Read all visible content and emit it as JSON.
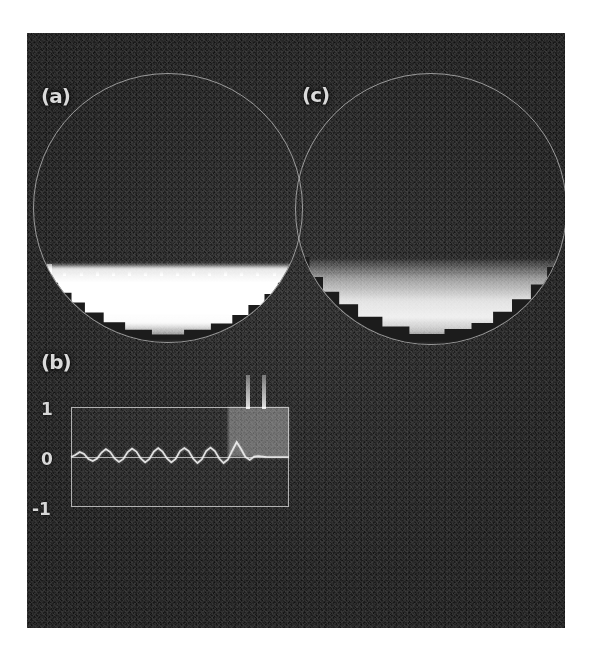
{
  "figure": {
    "background_color": "#ffffff",
    "panel_color": "#1c1c1c",
    "ink_color": "#d8d8d8",
    "panel_labels": {
      "a": "(a)",
      "b": "(b)",
      "c": "(c)"
    }
  },
  "chart_data": [
    {
      "id": "panel-a",
      "type": "heatmap",
      "title": "(a)",
      "description": "Circular domain, dark above, bright saturated condensate in lower region with a flat sharp interface and regular small spikes along it",
      "shape": "circle",
      "grid": false,
      "xlabel": "",
      "ylabel": "",
      "interface_fraction": 0.71,
      "spike_count": 16,
      "spike_heights": [
        12,
        4,
        4,
        5,
        4,
        5,
        4,
        5,
        4,
        5,
        4,
        5,
        4,
        4,
        4,
        12
      ],
      "brightness_profile": {
        "x": [
          0.0,
          0.7,
          0.72,
          0.78,
          0.88,
          0.93,
          0.97,
          1.0
        ],
        "y": [
          0.0,
          0.0,
          0.88,
          1.0,
          1.0,
          0.97,
          0.55,
          0.12
        ]
      }
    },
    {
      "id": "panel-c",
      "type": "heatmap",
      "title": "(c)",
      "description": "Circular domain, dark above, smoothly graded bright region in lower part, no spikes, diffuse interface",
      "shape": "circle",
      "grid": false,
      "xlabel": "",
      "ylabel": "",
      "interface_fraction": 0.68,
      "spike_count": 0,
      "brightness_profile": {
        "x": [
          0.0,
          0.68,
          0.71,
          0.76,
          0.84,
          0.9,
          0.95,
          0.99,
          1.0
        ],
        "y": [
          0.0,
          0.0,
          0.22,
          0.55,
          0.86,
          0.92,
          0.72,
          0.25,
          0.05
        ]
      }
    },
    {
      "id": "panel-b",
      "type": "line",
      "title": "(b)",
      "xlabel": "",
      "ylabel": "",
      "grid": false,
      "legend": "none",
      "ylim": [
        -1,
        1
      ],
      "ytick_labels": [
        "1",
        "0",
        "-1"
      ],
      "ytick_values": [
        1,
        0,
        -1
      ],
      "xlim": [
        0,
        1
      ],
      "series": [
        {
          "name": "oscillation",
          "x": [
            0.0,
            0.02,
            0.04,
            0.06,
            0.08,
            0.1,
            0.12,
            0.14,
            0.16,
            0.18,
            0.2,
            0.22,
            0.24,
            0.26,
            0.28,
            0.3,
            0.32,
            0.34,
            0.36,
            0.38,
            0.4,
            0.42,
            0.44,
            0.46,
            0.48,
            0.5,
            0.52,
            0.54,
            0.56,
            0.58,
            0.6,
            0.62,
            0.64,
            0.66,
            0.68,
            0.7,
            0.72,
            0.74,
            0.76,
            0.78,
            0.8,
            0.82,
            0.84,
            0.86,
            0.88,
            0.9,
            0.92,
            0.94,
            0.96,
            0.98,
            1.0
          ],
          "y": [
            0.0,
            0.04,
            0.1,
            0.06,
            -0.04,
            -0.08,
            -0.03,
            0.09,
            0.16,
            0.1,
            -0.03,
            -0.1,
            -0.04,
            0.1,
            0.17,
            0.11,
            -0.03,
            -0.11,
            -0.04,
            0.11,
            0.18,
            0.11,
            -0.03,
            -0.11,
            -0.04,
            0.12,
            0.18,
            0.12,
            -0.03,
            -0.12,
            -0.05,
            0.12,
            0.19,
            0.12,
            -0.03,
            -0.12,
            -0.05,
            0.13,
            0.3,
            0.16,
            0.0,
            -0.06,
            0.01,
            0.02,
            0.01,
            0.0,
            0.0,
            0.0,
            0.0,
            0.0,
            0.0
          ]
        }
      ],
      "annotations": {
        "highlight_band": {
          "x_start": 0.72,
          "x_end": 1.0,
          "y_start": 0.0,
          "y_end": 1.0
        },
        "vertical_spikes_above_axes": 2
      }
    }
  ]
}
